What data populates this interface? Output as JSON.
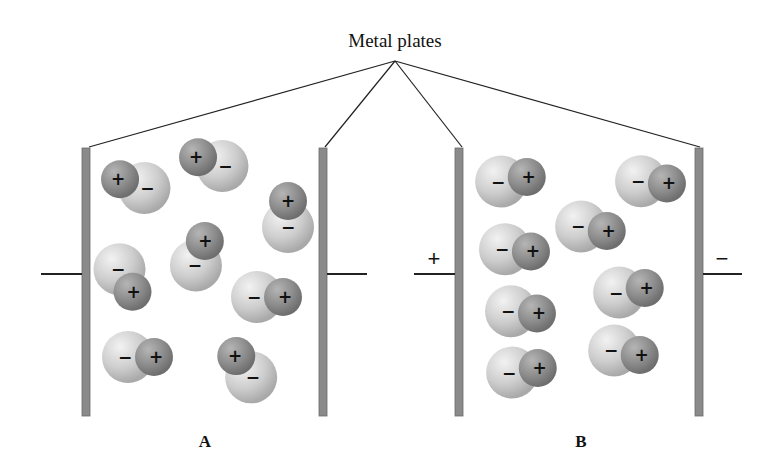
{
  "title": "Metal plates",
  "panels": [
    {
      "id": "A",
      "label": "A",
      "left_terminal_sign": "",
      "right_terminal_sign": "",
      "description": "Randomly oriented polar molecules, no applied voltage",
      "molecules": [
        {
          "orientation_deg": 200,
          "neg": "−",
          "pos": "+"
        },
        {
          "orientation_deg": 200,
          "neg": "−",
          "pos": "+"
        },
        {
          "orientation_deg": 270,
          "neg": "−",
          "pos": "+"
        },
        {
          "orientation_deg": 60,
          "neg": "−",
          "pos": "+"
        },
        {
          "orientation_deg": 290,
          "neg": "−",
          "pos": "+"
        },
        {
          "orientation_deg": 0,
          "neg": "−",
          "pos": "+"
        },
        {
          "orientation_deg": 0,
          "neg": "−",
          "pos": "+"
        },
        {
          "orientation_deg": 235,
          "neg": "−",
          "pos": "+"
        }
      ]
    },
    {
      "id": "B",
      "label": "B",
      "left_terminal_sign": "+",
      "right_terminal_sign": "−",
      "description": "Polar molecules aligned with applied field",
      "molecules": [
        {
          "orientation_deg": 350,
          "neg": "−",
          "pos": "+"
        },
        {
          "orientation_deg": 5,
          "neg": "−",
          "pos": "+"
        },
        {
          "orientation_deg": 10,
          "neg": "−",
          "pos": "+"
        },
        {
          "orientation_deg": 5,
          "neg": "−",
          "pos": "+"
        },
        {
          "orientation_deg": 350,
          "neg": "−",
          "pos": "+"
        },
        {
          "orientation_deg": 5,
          "neg": "−",
          "pos": "+"
        },
        {
          "orientation_deg": 350,
          "neg": "−",
          "pos": "+"
        },
        {
          "orientation_deg": 10,
          "neg": "−",
          "pos": "+"
        }
      ]
    }
  ],
  "colors": {
    "plate": "#8a8a8a",
    "negative_atom": "#cfcfcf",
    "positive_atom": "#8f8f8f",
    "line": "#222222"
  }
}
